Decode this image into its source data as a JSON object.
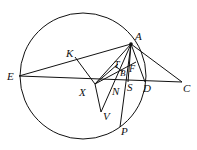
{
  "diagram": {
    "type": "geometry",
    "circle": {
      "cx": 83,
      "cy": 76,
      "r": 63
    },
    "points": {
      "A": {
        "x": 131,
        "y": 44,
        "label": "A",
        "lx": 135,
        "ly": 40
      },
      "E": {
        "x": 19,
        "y": 76,
        "label": "E",
        "lx": 7,
        "ly": 80
      },
      "C": {
        "x": 182,
        "y": 82,
        "label": "C",
        "lx": 183,
        "ly": 92
      },
      "D": {
        "x": 145,
        "y": 82,
        "label": "D",
        "lx": 143,
        "ly": 92
      },
      "K": {
        "x": 75,
        "y": 57,
        "label": "K",
        "lx": 66,
        "ly": 57
      },
      "X": {
        "x": 95,
        "y": 84,
        "label": "X",
        "lx": 79,
        "ly": 96
      },
      "V": {
        "x": 101,
        "y": 112,
        "label": "V",
        "lx": 103,
        "ly": 120
      },
      "P": {
        "x": 120,
        "y": 127,
        "label": "P",
        "lx": 121,
        "ly": 135
      },
      "T": {
        "x": 117,
        "y": 64,
        "label": "T",
        "lx": 115,
        "ly": 68
      },
      "B": {
        "x": 122,
        "y": 70,
        "label": "B",
        "lx": 121,
        "ly": 75
      },
      "F": {
        "x": 130,
        "y": 64,
        "label": "F",
        "lx": 129,
        "ly": 73
      },
      "N": {
        "x": 115,
        "y": 84,
        "label": "N",
        "lx": 113,
        "ly": 95
      },
      "S": {
        "x": 128,
        "y": 82,
        "label": "S",
        "lx": 127,
        "ly": 91
      }
    },
    "labels": [
      "A",
      "E",
      "C",
      "D",
      "K",
      "X",
      "V",
      "P",
      "T",
      "B",
      "F",
      "N",
      "S"
    ]
  }
}
